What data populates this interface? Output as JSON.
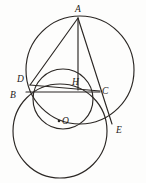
{
  "figure": {
    "background_color": "#fdfdfc",
    "stroke_color": "#2b2724",
    "labels": {
      "A": "A",
      "B": "B",
      "C": "C",
      "D": "D",
      "E": "E",
      "H": "H",
      "O": "O"
    },
    "points": {
      "A": {
        "x": 78,
        "y": 18
      },
      "B": {
        "x": 27,
        "y": 92
      },
      "C": {
        "x": 99,
        "y": 92
      },
      "D": {
        "x": 31,
        "y": 84
      },
      "E": {
        "x": 112,
        "y": 124
      },
      "H": {
        "x": 78,
        "y": 88
      },
      "O": {
        "x": 60,
        "y": 120
      }
    },
    "label_positions": {
      "A": {
        "x": 75,
        "y": 11
      },
      "B": {
        "x": 11,
        "y": 97
      },
      "C": {
        "x": 103,
        "y": 93
      },
      "D": {
        "x": 18,
        "y": 81
      },
      "E": {
        "x": 116,
        "y": 132
      },
      "H": {
        "x": 73,
        "y": 83
      },
      "O": {
        "x": 63,
        "y": 123
      }
    },
    "circles": [
      {
        "name": "circumcircle-ABE",
        "cx": 80,
        "cy": 70,
        "r": 54
      },
      {
        "name": "circle-O-small",
        "cx": 63,
        "cy": 99,
        "r": 30
      },
      {
        "name": "circle-lower-left",
        "cx": 60,
        "cy": 131,
        "r": 47
      }
    ],
    "segments": [
      {
        "name": "segment-AD",
        "from": "A",
        "to": "D"
      },
      {
        "name": "segment-AH",
        "from": "A",
        "to": "H"
      },
      {
        "name": "segment-AE",
        "from": "A",
        "to": "E"
      },
      {
        "name": "segment-BC",
        "from": "B",
        "to": "C"
      },
      {
        "name": "segment-DC",
        "from": "D",
        "to": "C"
      }
    ]
  }
}
